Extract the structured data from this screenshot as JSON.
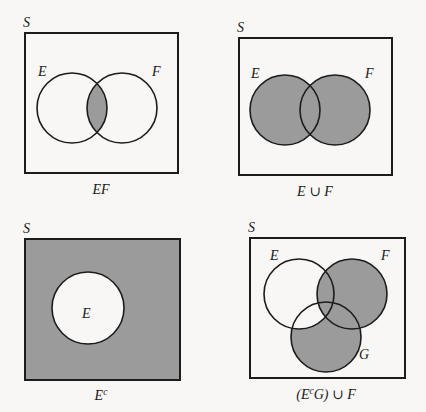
{
  "figure": {
    "background_color": "#f8f7f5",
    "shade_color": "#9b9b9b",
    "line_color": "#1c1c1c"
  },
  "panels": [
    {
      "id": "ef",
      "universe_label": "S",
      "caption": "EF",
      "caption_parts": [
        {
          "text": "EF",
          "sup": ""
        }
      ],
      "set_labels": [
        {
          "name": "E",
          "x": 39,
          "y": 74
        },
        {
          "name": "F",
          "x": 152,
          "y": 74
        }
      ],
      "shaded_description": "intersection of E and F",
      "frame": {
        "x": 25,
        "y": 33,
        "w": 153,
        "h": 140
      },
      "circles": [
        {
          "name": "E",
          "cx": 72,
          "cy": 108,
          "r": 35
        },
        {
          "name": "F",
          "cx": 122,
          "cy": 108,
          "r": 35
        }
      ]
    },
    {
      "id": "union",
      "universe_label": "S",
      "caption": "E ∪ F",
      "caption_parts": [
        {
          "text": "E",
          "sup": ""
        },
        {
          "text": "∪",
          "sup": ""
        },
        {
          "text": "F",
          "sup": ""
        }
      ],
      "set_labels": [
        {
          "name": "E",
          "x": 39,
          "y": 74
        },
        {
          "name": "F",
          "x": 152,
          "y": 74
        }
      ],
      "shaded_description": "union of E and F",
      "frame": {
        "x": 39,
        "y": 38,
        "w": 153,
        "h": 137
      },
      "circles": [
        {
          "name": "E",
          "cx": 85,
          "cy": 110,
          "r": 35
        },
        {
          "name": "F",
          "cx": 135,
          "cy": 110,
          "r": 35
        }
      ]
    },
    {
      "id": "complement",
      "universe_label": "S",
      "caption": "Eᶜ",
      "caption_parts": [
        {
          "text": "E",
          "sup": "c"
        }
      ],
      "set_labels": [
        {
          "name": "E",
          "x": 83,
          "y": 318
        }
      ],
      "shaded_description": "everything in S outside E",
      "frame": {
        "x": 25,
        "y": 239,
        "w": 155,
        "h": 141
      },
      "circles": [
        {
          "name": "E",
          "cx": 88,
          "cy": 308,
          "r": 36
        }
      ]
    },
    {
      "id": "complex",
      "universe_label": "S",
      "caption": "(EᶜG) ∪ F",
      "caption_parts": [
        {
          "text": "(E",
          "sup": "c"
        },
        {
          "text": "G) ∪ F",
          "sup": ""
        }
      ],
      "set_labels": [
        {
          "name": "E",
          "x": 272,
          "y": 258
        },
        {
          "name": "F",
          "x": 383,
          "y": 258
        },
        {
          "name": "G",
          "x": 360,
          "y": 356
        }
      ],
      "shaded_description": "F entirely, plus the part of G not in E",
      "frame": {
        "x": 250,
        "y": 238,
        "w": 155,
        "h": 140
      },
      "circles": [
        {
          "name": "E",
          "cx": 299,
          "cy": 294,
          "r": 35
        },
        {
          "name": "F",
          "cx": 352,
          "cy": 294,
          "r": 35
        },
        {
          "name": "G",
          "cx": 326,
          "cy": 337,
          "r": 35
        }
      ]
    }
  ],
  "captions": {
    "ef": "EF",
    "union_e_f": "E ∪ F",
    "complement_e": "E",
    "complement_e_sup": "c",
    "complex_open": "(E",
    "complex_sup": "c",
    "complex_rest": "G) ∪ F"
  },
  "labels": {
    "S": "S",
    "E": "E",
    "F": "F",
    "G": "G",
    "union_glyph": "∪"
  }
}
